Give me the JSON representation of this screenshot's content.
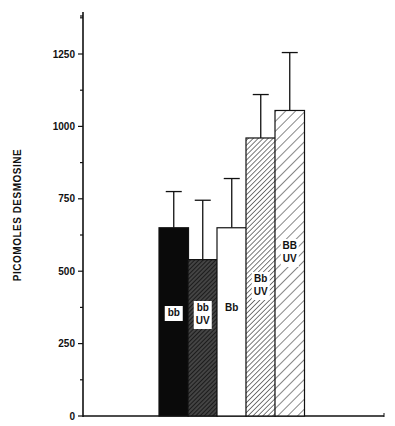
{
  "chart_data": {
    "type": "bar",
    "title": "",
    "xlabel": "",
    "ylabel": "PICOMOLES DESMOSINE",
    "ylim": [
      0,
      1400
    ],
    "yticks": [
      0,
      250,
      500,
      750,
      1000,
      1250
    ],
    "grid": false,
    "legend": "none (labels drawn inside bars)",
    "categories": [
      "bb",
      "bb UV",
      "Bb",
      "Bb UV",
      "BB UV"
    ],
    "values": [
      650,
      540,
      650,
      960,
      1055
    ],
    "error_upper": [
      775,
      745,
      820,
      1110,
      1255
    ],
    "fills": [
      "solid black",
      "dense dark hatch",
      "white",
      "fine diagonal hatch",
      "wide diagonal hatch"
    ]
  },
  "labels": {
    "ylabel": "PICOMOLES DESMOSINE",
    "yticks": [
      "0",
      "250",
      "500",
      "750",
      "1000",
      "1250"
    ],
    "bars": [
      {
        "line1": "bb",
        "line2": ""
      },
      {
        "line1": "bb",
        "line2": "UV"
      },
      {
        "line1": "Bb",
        "line2": ""
      },
      {
        "line1": "Bb",
        "line2": "UV"
      },
      {
        "line1": "BB",
        "line2": "UV"
      }
    ]
  }
}
